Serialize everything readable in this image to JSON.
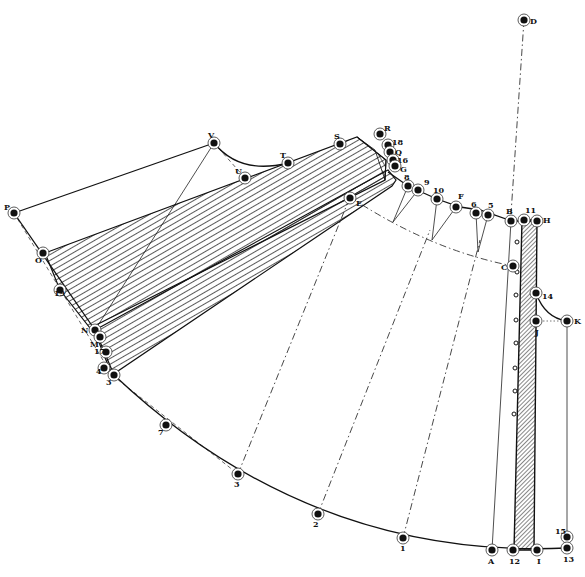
{
  "diagram": {
    "title": "",
    "colors": {
      "ink": "#111111",
      "paper": "#ffffff"
    },
    "points": [
      {
        "id": "D",
        "label": "D"
      },
      {
        "id": "P",
        "label": "P"
      },
      {
        "id": "O",
        "label": "O"
      },
      {
        "id": "V",
        "label": "V"
      },
      {
        "id": "U",
        "label": "U"
      },
      {
        "id": "T",
        "label": "T"
      },
      {
        "id": "S",
        "label": "S"
      },
      {
        "id": "R",
        "label": "R"
      },
      {
        "id": "18",
        "label": "18"
      },
      {
        "id": "Q",
        "label": "Q"
      },
      {
        "id": "16",
        "label": "16"
      },
      {
        "id": "G",
        "label": "G"
      },
      {
        "id": "E",
        "label": "E"
      },
      {
        "id": "8",
        "label": "8"
      },
      {
        "id": "9",
        "label": "9"
      },
      {
        "id": "10",
        "label": "10"
      },
      {
        "id": "F",
        "label": "F"
      },
      {
        "id": "6",
        "label": "6"
      },
      {
        "id": "5",
        "label": "5"
      },
      {
        "id": "B",
        "label": "B"
      },
      {
        "id": "11",
        "label": "11"
      },
      {
        "id": "H",
        "label": "H"
      },
      {
        "id": "C",
        "label": "C"
      },
      {
        "id": "14",
        "label": "14"
      },
      {
        "id": "J",
        "label": "J"
      },
      {
        "id": "K",
        "label": "K"
      },
      {
        "id": "19",
        "label": "19"
      },
      {
        "id": "N",
        "label": "N"
      },
      {
        "id": "M",
        "label": "M"
      },
      {
        "id": "17",
        "label": "17"
      },
      {
        "id": "4",
        "label": "4"
      },
      {
        "id": "3",
        "label": "3"
      },
      {
        "id": "p7",
        "label": "7"
      },
      {
        "id": "p3",
        "label": "3"
      },
      {
        "id": "p2",
        "label": "2"
      },
      {
        "id": "p1",
        "label": "1"
      },
      {
        "id": "A",
        "label": "A"
      },
      {
        "id": "12",
        "label": "12"
      },
      {
        "id": "I",
        "label": "I"
      },
      {
        "id": "15",
        "label": "15"
      },
      {
        "id": "13",
        "label": "13"
      }
    ],
    "caption": ""
  }
}
